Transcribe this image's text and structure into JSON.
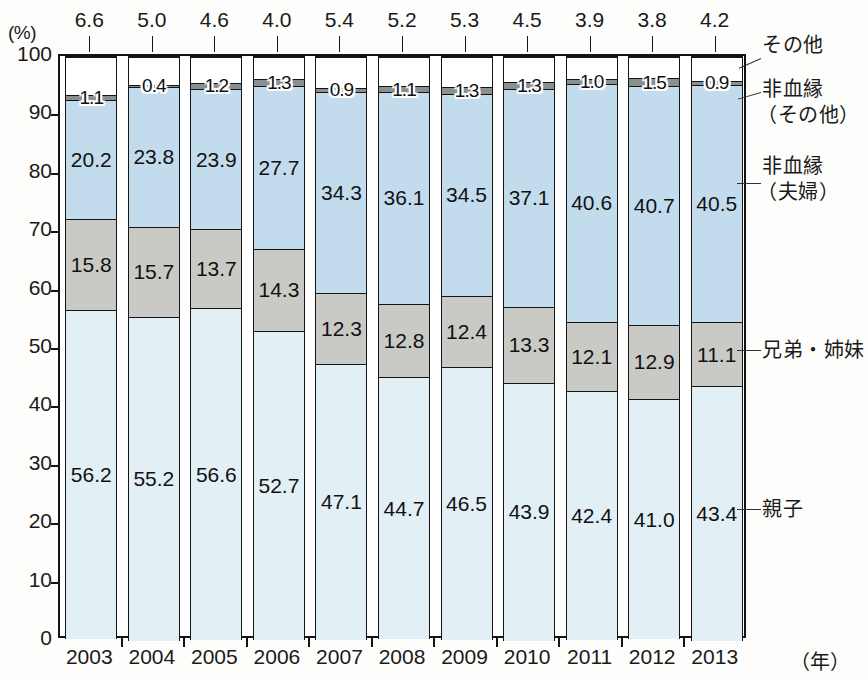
{
  "axes": {
    "y_unit": "(%)",
    "x_unit": "（年）",
    "y_ticks": [
      "100",
      "90",
      "80",
      "70",
      "60",
      "50",
      "40",
      "30",
      "20",
      "10",
      "0"
    ],
    "x_ticks": [
      "2003",
      "2004",
      "2005",
      "2006",
      "2007",
      "2008",
      "2009",
      "2010",
      "2011",
      "2012",
      "2013"
    ]
  },
  "series_labels": {
    "other": "その他",
    "nonkin_other_l1": "非血縁",
    "nonkin_other_l2": "（その他）",
    "nonkin_couple_l1": "非血縁",
    "nonkin_couple_l2": "（夫婦）",
    "sibling": "兄弟・姉妹",
    "parent": "親子"
  },
  "colors": {
    "other": "#ffffff",
    "nonkin_other": "#8a8f8f",
    "nonkin_couple": "#c2dcee",
    "sibling": "#c9cac6",
    "parent": "#e2eff4",
    "outline": "#141414"
  },
  "chart_data": {
    "type": "bar",
    "title": "",
    "subtype": "stacked-100-percent",
    "xlabel": "（年）",
    "ylabel": "(%)",
    "ylim": [
      0,
      100
    ],
    "ytick_step": 10,
    "grid": false,
    "legend_position": "right-inline-labels",
    "categories": [
      "2003",
      "2004",
      "2005",
      "2006",
      "2007",
      "2008",
      "2009",
      "2010",
      "2011",
      "2012",
      "2013"
    ],
    "series": [
      {
        "name": "親子",
        "key": "parent",
        "color": "#e2eff4",
        "values": [
          56.2,
          55.2,
          56.6,
          52.7,
          47.1,
          44.7,
          46.5,
          43.9,
          42.4,
          41.0,
          43.4
        ],
        "labels": [
          "56.2",
          "55.2",
          "56.6",
          "52.7",
          "47.1",
          "44.7",
          "46.5",
          "43.9",
          "42.4",
          "41.0",
          "43.4"
        ]
      },
      {
        "name": "兄弟・姉妹",
        "key": "sibling",
        "color": "#c9cac6",
        "values": [
          15.8,
          15.7,
          13.7,
          14.3,
          12.3,
          12.8,
          12.4,
          13.3,
          12.1,
          12.9,
          11.1
        ],
        "labels": [
          "15.8",
          "15.7",
          "13.7",
          "14.3",
          "12.3",
          "12.8",
          "12.4",
          "13.3",
          "12.1",
          "12.9",
          "11.1"
        ]
      },
      {
        "name": "非血縁（夫婦）",
        "key": "nonkin_couple",
        "color": "#c2dcee",
        "values": [
          20.2,
          23.8,
          23.9,
          27.7,
          34.3,
          36.1,
          34.5,
          37.1,
          40.6,
          40.7,
          40.5
        ],
        "labels": [
          "20.2",
          "23.8",
          "23.9",
          "27.7",
          "34.3",
          "36.1",
          "34.5",
          "37.1",
          "40.6",
          "40.7",
          "40.5"
        ]
      },
      {
        "name": "非血縁（その他）",
        "key": "nonkin_other",
        "color": "#8a8f8f",
        "values": [
          1.1,
          0.4,
          1.2,
          1.3,
          0.9,
          1.1,
          1.3,
          1.3,
          1.0,
          1.5,
          0.9
        ],
        "labels": [
          "1.1",
          "0.4",
          "1.2",
          "1.3",
          "0.9",
          "1.1",
          "1.3",
          "1.3",
          "1.0",
          "1.5",
          "0.9"
        ]
      },
      {
        "name": "その他",
        "key": "other",
        "color": "#ffffff",
        "values": [
          6.6,
          5.0,
          4.6,
          4.0,
          5.4,
          5.2,
          5.3,
          4.5,
          3.9,
          3.8,
          4.2
        ],
        "labels": [
          "6.6",
          "5.0",
          "4.6",
          "4.0",
          "5.4",
          "5.2",
          "5.3",
          "4.5",
          "3.9",
          "3.8",
          "4.2"
        ]
      }
    ]
  }
}
